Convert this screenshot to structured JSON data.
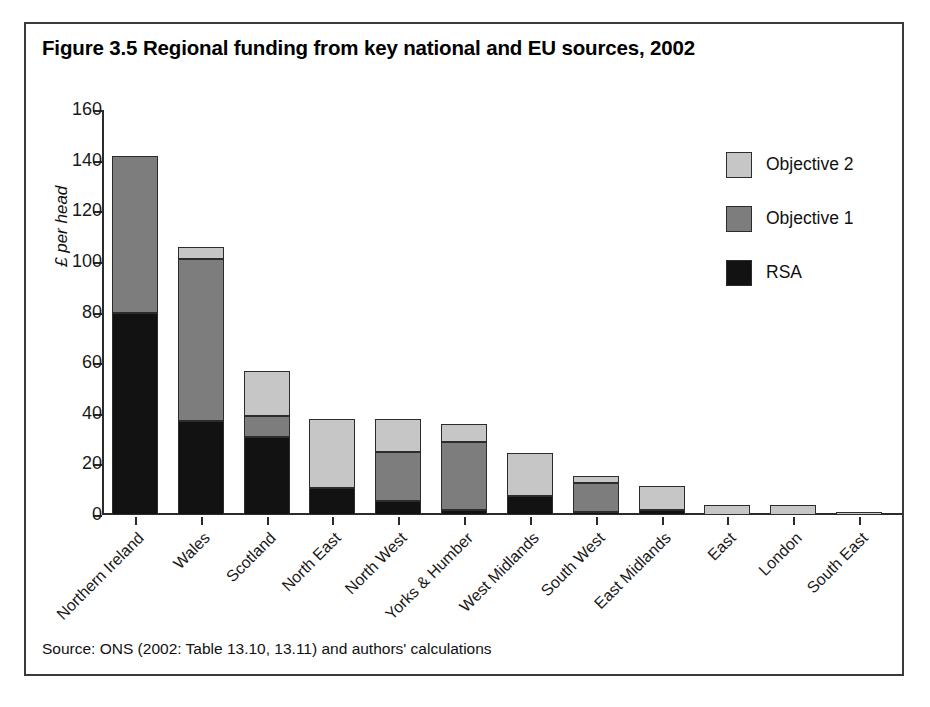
{
  "figure": {
    "title": "Figure 3.5 Regional funding from key national and EU sources, 2002",
    "source_note": "Source: ONS (2002: Table 13.10, 13.11) and authors' calculations"
  },
  "legend": {
    "position": "top-right",
    "items": [
      {
        "label": "Objective 2",
        "color": "#c6c6c6",
        "swatch_name": "legend-swatch-objective-2"
      },
      {
        "label": "Objective 1",
        "color": "#7d7d7d",
        "swatch_name": "legend-swatch-objective-1"
      },
      {
        "label": "RSA",
        "color": "#121212",
        "swatch_name": "legend-swatch-rsa"
      }
    ]
  },
  "chart_data": {
    "type": "bar",
    "stacked": true,
    "title": "Figure 3.5 Regional funding from key national and EU sources, 2002",
    "xlabel": "",
    "ylabel": "£ per head",
    "ylim": [
      0,
      160
    ],
    "yticks": [
      0,
      20,
      40,
      60,
      80,
      100,
      120,
      140,
      160
    ],
    "ytick_labels": [
      "0",
      "20",
      "40",
      "60",
      "80",
      "100",
      "120",
      "140",
      "160"
    ],
    "grid": false,
    "legend_position": "top-right",
    "categories": [
      "Northern Ireland",
      "Wales",
      "Scotland",
      "North East",
      "North West",
      "Yorks & Humber",
      "West Midlands",
      "South West",
      "East Midlands",
      "East",
      "London",
      "South East"
    ],
    "series": [
      {
        "name": "RSA",
        "color": "#121212",
        "values": [
          80,
          37,
          31,
          10.5,
          5.5,
          2,
          7.5,
          1,
          2,
          0,
          0,
          0
        ]
      },
      {
        "name": "Objective 1",
        "color": "#7d7d7d",
        "values": [
          62,
          64,
          8,
          0,
          19.5,
          27,
          0,
          11.5,
          0,
          0,
          0,
          0
        ]
      },
      {
        "name": "Objective 2",
        "color": "#c6c6c6",
        "values": [
          0,
          5,
          18,
          27.5,
          13,
          7,
          17,
          3,
          9.5,
          4,
          4,
          1
        ]
      }
    ],
    "totals": [
      142,
      106,
      57,
      38,
      38,
      36,
      24.5,
      15.5,
      11.5,
      4,
      4,
      1
    ]
  }
}
